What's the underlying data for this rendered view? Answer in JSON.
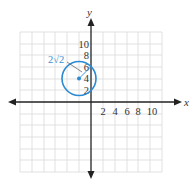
{
  "figure": {
    "type": "coordinate-plane-with-circle",
    "x_axis_label": "x",
    "y_axis_label": "y",
    "x_tick_labels": [
      "2",
      "4",
      "6",
      "8",
      "10"
    ],
    "y_tick_labels": [
      "2",
      "4",
      "6",
      "8",
      "10"
    ],
    "grid_step": 2,
    "range": {
      "xmin": -12,
      "xmax": 12,
      "ymin": -12,
      "ymax": 12
    },
    "circle": {
      "center": {
        "x": -2,
        "y": 4
      },
      "radius_label": "2√2",
      "radius_value": 2.828,
      "color": "#2a8ad4"
    },
    "colors": {
      "grid": "#d6d6d6",
      "axis": "#222222",
      "circle": "#2a8ad4",
      "annotation": "#3a8fd0"
    }
  }
}
